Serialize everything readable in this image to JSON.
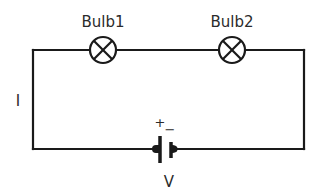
{
  "diagram": {
    "type": "series circuit",
    "components": {
      "bulb1": {
        "label": "Bulb1",
        "symbol": "lamp",
        "cx": 103,
        "cy": 50
      },
      "bulb2": {
        "label": "Bulb2",
        "symbol": "lamp",
        "cx": 232,
        "cy": 50
      },
      "battery": {
        "label": "V",
        "positive_sign": "+",
        "negative_sign": "−",
        "symbol": "cell"
      }
    },
    "current_label": "I",
    "colors": {
      "wire": "#1a1a1a",
      "text": "#2b2b2b",
      "background": "#ffffff"
    }
  }
}
